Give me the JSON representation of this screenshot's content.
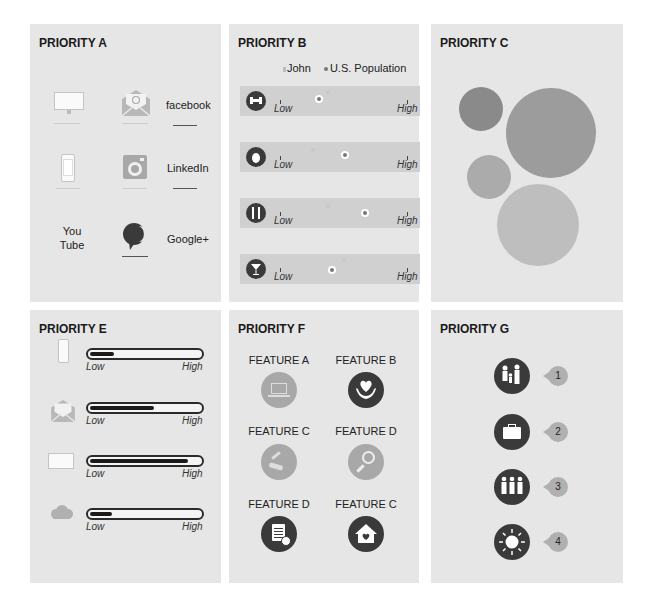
{
  "panels": {
    "a": {
      "title": "PRIORITY A",
      "items": [
        {
          "icon": "desktop-icon"
        },
        {
          "icon": "email-icon"
        },
        {
          "label": "facebook"
        },
        {
          "icon": "phone-icon"
        },
        {
          "icon": "instagram-icon"
        },
        {
          "label": "LinkedIn"
        },
        {
          "label": "You\nTube",
          "line1": "You",
          "line2": "Tube"
        },
        {
          "icon": "chat-bubble-icon"
        },
        {
          "label": "Google+"
        }
      ]
    },
    "b": {
      "title": "PRIORITY B",
      "legend": {
        "john": "John",
        "population": "U.S. Population"
      },
      "low": "Low",
      "high": "High",
      "rows": [
        {
          "icon": "dumbbell-icon",
          "john": 0.38,
          "population": 0.32
        },
        {
          "icon": "apple-icon",
          "john": 0.28,
          "population": 0.52
        },
        {
          "icon": "utensils-icon",
          "john": 0.42,
          "population": 0.66
        },
        {
          "icon": "cocktail-icon",
          "john": 0.58,
          "population": 0.45
        }
      ]
    },
    "c": {
      "title": "PRIORITY C",
      "bubbles": [
        {
          "cx": 50,
          "cy": 108,
          "r": 22,
          "color": "#8a8a8a"
        },
        {
          "cx": 125,
          "cy": 130,
          "r": 45,
          "color": "#9a9a9a"
        },
        {
          "cx": 57,
          "cy": 177,
          "r": 22,
          "color": "#aaaaaa"
        },
        {
          "cx": 113,
          "cy": 226,
          "r": 41,
          "color": "#bdbdbd"
        }
      ]
    },
    "e": {
      "title": "PRIORITY E",
      "low": "Low",
      "high": "High",
      "rows": [
        {
          "icon": "phone-icon",
          "value": 22
        },
        {
          "icon": "email-icon",
          "value": 58
        },
        {
          "icon": "desktop-icon",
          "value": 88
        },
        {
          "icon": "cloud-icon",
          "value": 20
        }
      ]
    },
    "f": {
      "title": "PRIORITY F",
      "features": [
        {
          "label": "FEATURE A",
          "icon": "computer-devices-icon",
          "dark": false
        },
        {
          "label": "FEATURE B",
          "icon": "heart-hands-icon",
          "dark": true
        },
        {
          "label": "FEATURE C",
          "icon": "tools-icon",
          "dark": false
        },
        {
          "label": "FEATURE D",
          "icon": "search-person-icon",
          "dark": false
        },
        {
          "label": "FEATURE D",
          "icon": "invoice-icon",
          "dark": true
        },
        {
          "label": "FEATURE C",
          "icon": "home-heart-icon",
          "dark": true
        }
      ]
    },
    "g": {
      "title": "PRIORITY G",
      "items": [
        {
          "icon": "family-icon",
          "rank": "1"
        },
        {
          "icon": "briefcase-icon",
          "rank": "2"
        },
        {
          "icon": "group-icon",
          "rank": "3"
        },
        {
          "icon": "sun-icon",
          "rank": "4"
        }
      ]
    }
  },
  "colors": {
    "panel_bg": "#e6e6e6",
    "dark_icon": "#3a3a3a",
    "light_icon": "#a8a8a8",
    "row_bg": "#d0d0d0"
  }
}
